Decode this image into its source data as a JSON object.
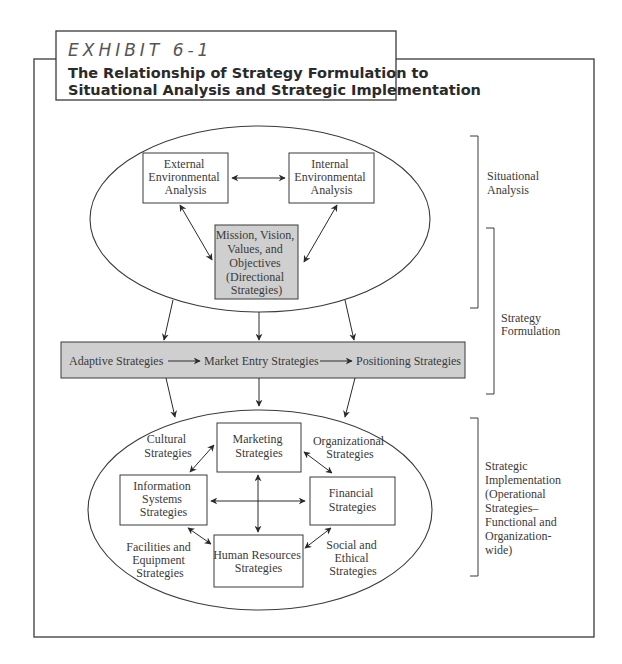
{
  "header": {
    "exhibit_label": "EXHIBIT 6-1",
    "title_line1": "The Relationship of Strategy Formulation to",
    "title_line2": "Situational Analysis and Strategic Implementation"
  },
  "situational": {
    "external": [
      "External",
      "Environmental",
      "Analysis"
    ],
    "internal": [
      "Internal",
      "Environmental",
      "Analysis"
    ],
    "mission": [
      "Mission, Vision,",
      "Values, and",
      "Objectives",
      "(Directional",
      "Strategies)"
    ]
  },
  "formulation": {
    "adaptive": "Adaptive Strategies",
    "market_entry": "Market Entry Strategies",
    "positioning": "Positioning Strategies"
  },
  "implementation": {
    "marketing": [
      "Marketing",
      "Strategies"
    ],
    "information_systems": [
      "Information",
      "Systems",
      "Strategies"
    ],
    "financial": [
      "Financial",
      "Strategies"
    ],
    "human_resources": [
      "Human Resources",
      "Strategies"
    ],
    "cultural": [
      "Cultural",
      "Strategies"
    ],
    "organizational": [
      "Organizational",
      "Strategies"
    ],
    "facilities": [
      "Facilities and",
      "Equipment",
      "Strategies"
    ],
    "social_ethical": [
      "Social and",
      "Ethical",
      "Strategies"
    ]
  },
  "side_labels": {
    "situational_analysis": [
      "Situational",
      "Analysis"
    ],
    "strategy_formulation": [
      "Strategy",
      "Formulation"
    ],
    "strategic_implementation": [
      "Strategic",
      "Implementation",
      "(Operational",
      "Strategies–",
      "Functional and",
      "Organization-",
      "wide)"
    ]
  },
  "colors": {
    "gray_fill": "#cfcfcf",
    "line": "#3a3a3a"
  }
}
